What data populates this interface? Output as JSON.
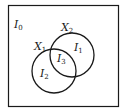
{
  "diagram": {
    "type": "venn",
    "universe_label": {
      "main": "I",
      "sub": "0"
    },
    "sets": [
      {
        "name": {
          "main": "X",
          "sub": "1"
        },
        "region_label": {
          "main": "I",
          "sub": "2"
        }
      },
      {
        "name": {
          "main": "X",
          "sub": "2"
        },
        "region_label": {
          "main": "I",
          "sub": "1"
        }
      }
    ],
    "intersection_label": {
      "main": "I",
      "sub": "3"
    },
    "colors": {
      "stroke": "#1a1a1a",
      "background": "#ffffff"
    }
  }
}
